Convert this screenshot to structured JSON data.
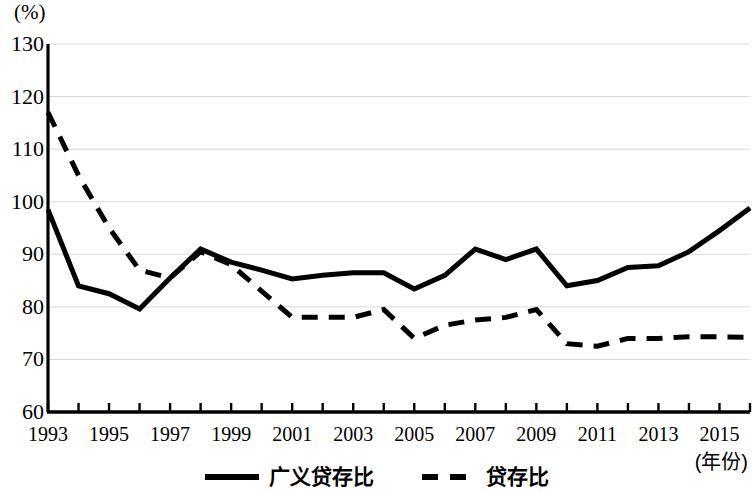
{
  "chart_data": {
    "type": "line",
    "title": "",
    "ylabel": "(%)",
    "xlabel": "(年份)",
    "ylim": [
      60,
      130
    ],
    "yticks": [
      60,
      70,
      80,
      90,
      100,
      110,
      120,
      130
    ],
    "grid": true,
    "xlim": [
      1993,
      2016
    ],
    "x": [
      1993,
      1994,
      1995,
      1996,
      1997,
      1998,
      1999,
      2000,
      2001,
      2002,
      2003,
      2004,
      2005,
      2006,
      2007,
      2008,
      2009,
      2010,
      2011,
      2012,
      2013,
      2014,
      2015,
      2016
    ],
    "xtick_labels": [
      "1993",
      "1995",
      "1997",
      "1999",
      "2001",
      "2003",
      "2005",
      "2007",
      "2009",
      "2011",
      "2013",
      "2015"
    ],
    "xtick_values": [
      1993,
      1995,
      1997,
      1999,
      2001,
      2003,
      2005,
      2007,
      2009,
      2011,
      2013,
      2015
    ],
    "legend_position": "bottom",
    "series": [
      {
        "name": "广义贷存比",
        "style": "solid",
        "color": "#000000",
        "values": [
          98.5,
          84.0,
          82.5,
          79.6,
          85.5,
          91.0,
          88.5,
          87.0,
          85.3,
          86.0,
          86.5,
          86.5,
          83.4,
          86.0,
          91.0,
          89.0,
          91.0,
          84.0,
          85.0,
          87.5,
          87.8,
          90.5,
          94.5,
          98.8
        ]
      },
      {
        "name": "贷存比",
        "style": "dashed",
        "color": "#000000",
        "values": [
          117.0,
          105.0,
          95.0,
          87.0,
          85.5,
          90.5,
          88.0,
          83.0,
          78.0,
          78.0,
          78.0,
          79.5,
          74.0,
          76.5,
          77.5,
          78.0,
          79.5,
          73.0,
          72.5,
          74.0,
          74.0,
          74.3,
          74.3,
          74.2
        ]
      }
    ]
  },
  "legend": {
    "items": [
      {
        "label": "广义贷存比",
        "style": "solid"
      },
      {
        "label": "贷存比",
        "style": "dashed"
      }
    ]
  },
  "axes": {
    "y_unit": "(%)",
    "x_unit": "(年份)"
  }
}
